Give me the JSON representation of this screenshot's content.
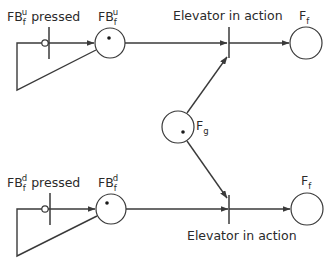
{
  "diagram": {
    "type": "petri-net",
    "colors": {
      "stroke": "#3a3a3a",
      "text": "#2a2a2a",
      "background": "#ffffff"
    },
    "places": [
      {
        "id": "FBfu",
        "base": "FB",
        "sub": "f",
        "sup": "u",
        "token": true
      },
      {
        "id": "FBfd",
        "base": "FB",
        "sub": "f",
        "sup": "d",
        "token": true
      },
      {
        "id": "Fg",
        "base": "F",
        "sub": "g",
        "token": true
      },
      {
        "id": "Ff_top",
        "base": "F",
        "sub": "f",
        "token": false
      },
      {
        "id": "Ff_bottom",
        "base": "F",
        "sub": "f",
        "token": false
      }
    ],
    "transitions": [
      {
        "id": "t_up_pressed",
        "label_base": "FB",
        "label_sub": "f",
        "label_sup": "u",
        "label_suffix": " pressed",
        "inhibitor": true
      },
      {
        "id": "t_down_pressed",
        "label_base": "FB",
        "label_sub": "f",
        "label_sup": "d",
        "label_suffix": " pressed",
        "inhibitor": true
      },
      {
        "id": "t_elevator_top",
        "label": "Elevator in action"
      },
      {
        "id": "t_elevator_bottom",
        "label": "Elevator in action"
      }
    ],
    "arcs": [
      {
        "from": "FBfu",
        "to": "t_up_pressed",
        "kind": "inhibitor"
      },
      {
        "from": "t_up_pressed",
        "to": "FBfu"
      },
      {
        "from": "FBfu",
        "to": "t_elevator_top"
      },
      {
        "from": "Fg",
        "to": "t_elevator_top"
      },
      {
        "from": "t_elevator_top",
        "to": "Ff_top"
      },
      {
        "from": "FBfd",
        "to": "t_down_pressed",
        "kind": "inhibitor"
      },
      {
        "from": "t_down_pressed",
        "to": "FBfd"
      },
      {
        "from": "FBfd",
        "to": "t_elevator_bottom"
      },
      {
        "from": "Fg",
        "to": "t_elevator_bottom"
      },
      {
        "from": "t_elevator_bottom",
        "to": "Ff_bottom"
      }
    ]
  }
}
